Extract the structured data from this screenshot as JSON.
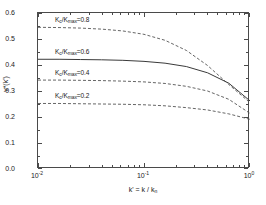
{
  "chart_data": {
    "type": "line",
    "title": "",
    "xlabel": "k' = k / k_n",
    "ylabel": "v*(k')",
    "xscale": "log",
    "yscale": "linear",
    "xlim": [
      0.01,
      1.0
    ],
    "ylim": [
      0.0,
      0.6
    ],
    "grid": false,
    "legend_position": "inline-annotations",
    "y_ticks": [
      "0.0",
      "0.1",
      "0.2",
      "0.3",
      "0.4",
      "0.5",
      "0.6"
    ],
    "y_tick_values": [
      0.0,
      0.1,
      0.2,
      0.3,
      0.4,
      0.5,
      0.6
    ],
    "x_ticks": [
      "10-2",
      "10-1",
      "100"
    ],
    "x_tick_values": [
      0.01,
      0.1,
      1.0
    ],
    "x_tick_mantissa": [
      "10",
      "10",
      "10"
    ],
    "x_tick_exponent": [
      "-2",
      "-1",
      "0"
    ],
    "series": [
      {
        "name": "Kc/Kmax=0.8",
        "label": "K_c/K_max=0.8",
        "style": "dashed",
        "color": "#555555",
        "x": [
          0.01,
          0.0158,
          0.0251,
          0.0398,
          0.0631,
          0.1,
          0.158,
          0.251,
          0.398,
          0.631,
          1.0
        ],
        "values": [
          0.545,
          0.544,
          0.542,
          0.538,
          0.531,
          0.518,
          0.495,
          0.456,
          0.398,
          0.325,
          0.255
        ]
      },
      {
        "name": "Kc/Kmax=0.6",
        "label": "K_c/K_max=0.6",
        "style": "solid",
        "color": "#3a3a3a",
        "x": [
          0.01,
          0.0158,
          0.0251,
          0.0398,
          0.0631,
          0.1,
          0.158,
          0.251,
          0.398,
          0.631,
          1.0
        ],
        "values": [
          0.422,
          0.422,
          0.421,
          0.42,
          0.418,
          0.414,
          0.407,
          0.394,
          0.37,
          0.33,
          0.262
        ]
      },
      {
        "name": "Kc/Kmax=0.4",
        "label": "K_c/K_max=0.4",
        "style": "dashed",
        "color": "#555555",
        "x": [
          0.01,
          0.0158,
          0.0251,
          0.0398,
          0.0631,
          0.1,
          0.158,
          0.251,
          0.398,
          0.631,
          1.0
        ],
        "values": [
          0.342,
          0.342,
          0.341,
          0.34,
          0.338,
          0.335,
          0.329,
          0.318,
          0.3,
          0.268,
          0.214
        ]
      },
      {
        "name": "Kc/Kmax=0.2",
        "label": "K_c/K_max=0.2",
        "style": "dashed",
        "color": "#555555",
        "x": [
          0.01,
          0.0158,
          0.0251,
          0.0398,
          0.0631,
          0.1,
          0.158,
          0.251,
          0.398,
          0.631,
          1.0
        ],
        "values": [
          0.252,
          0.252,
          0.251,
          0.25,
          0.249,
          0.247,
          0.243,
          0.236,
          0.227,
          0.212,
          0.191
        ]
      }
    ],
    "annotations": [
      {
        "text": "K_c/K_max=0.8",
        "x": 0.0145,
        "y": 0.572
      },
      {
        "text": "K_c/K_max=0.6",
        "x": 0.0145,
        "y": 0.452
      },
      {
        "text": "K_c/K_max=0.4",
        "x": 0.0145,
        "y": 0.37
      },
      {
        "text": "K_c/K_max=0.2",
        "x": 0.0145,
        "y": 0.28
      }
    ]
  },
  "axes": {
    "y_title_main": "v",
    "y_title_star": "*",
    "y_title_rest": "(k",
    "y_title_prime": "'",
    "y_title_close": ")",
    "y_title_plain": "v*(k')",
    "x_title_plain": "k' = k / k",
    "x_title_sub": "n",
    "yticks": [
      {
        "label": "0.6",
        "value": 0.6
      },
      {
        "label": "0.5",
        "value": 0.5
      },
      {
        "label": "0.4",
        "value": 0.4
      },
      {
        "label": "0.3",
        "value": 0.3
      },
      {
        "label": "0.2",
        "value": 0.2
      },
      {
        "label": "0.1",
        "value": 0.1
      },
      {
        "label": "0.0",
        "value": 0.0
      }
    ],
    "xticks": [
      {
        "base": "10",
        "exp": "-2",
        "value": 0.01
      },
      {
        "base": "10",
        "exp": "-1",
        "value": 0.1
      },
      {
        "base": "10",
        "exp": "0",
        "value": 1.0
      }
    ]
  },
  "labels": {
    "l0": {
      "prefix": "K",
      "sub1": "c",
      "mid": "/K",
      "sub2": "max",
      "suffix": "=0.8"
    },
    "l1": {
      "prefix": "K",
      "sub1": "c",
      "mid": "/K",
      "sub2": "max",
      "suffix": "=0.6"
    },
    "l2": {
      "prefix": "K",
      "sub1": "c",
      "mid": "/K",
      "sub2": "max",
      "suffix": "=0.4"
    },
    "l3": {
      "prefix": "K",
      "sub1": "c",
      "mid": "/K",
      "sub2": "max",
      "suffix": "=0.2"
    }
  },
  "colors": {
    "frame": "#4a4a4a",
    "solid_curve": "#3a3a3a",
    "dashed_curve": "#555555",
    "text": "#1a1a1a",
    "background": "#ffffff"
  }
}
